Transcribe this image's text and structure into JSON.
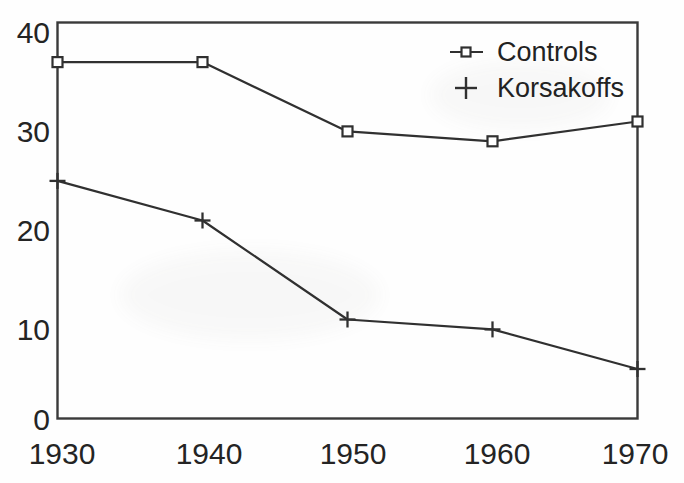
{
  "chart_data": {
    "type": "line",
    "title": "",
    "subtitle": "",
    "xlabel": "",
    "ylabel": "",
    "x": [
      1930,
      1940,
      1950,
      1960,
      1970
    ],
    "categories": [
      "1930",
      "1940",
      "1950",
      "1960",
      "1970"
    ],
    "series": [
      {
        "name": "Controls",
        "marker": "open-square",
        "color": "#303030",
        "values": [
          36,
          36,
          29,
          28,
          30
        ]
      },
      {
        "name": "Korsakoffs",
        "marker": "plus",
        "color": "#303030",
        "values": [
          24,
          20,
          10,
          9,
          5
        ]
      }
    ],
    "xlim": [
      1930,
      1970
    ],
    "ylim": [
      0,
      40
    ],
    "y_ticks": [
      0,
      10,
      20,
      30,
      40
    ],
    "y_tick_labels": [
      "0",
      "10",
      "20",
      "30",
      "40"
    ],
    "x_ticks": [
      1930,
      1940,
      1950,
      1960,
      1970
    ],
    "x_tick_labels": [
      "1930",
      "1940",
      "1950",
      "1960",
      "1970"
    ],
    "grid": false,
    "legend_position": "top-right",
    "frame": "box"
  },
  "legend": {
    "entries": [
      {
        "label": "Controls",
        "marker": "open-square-with-line"
      },
      {
        "label": "Korsakoffs",
        "marker": "plus"
      }
    ]
  },
  "axes": {
    "y_labels": [
      "40",
      "30",
      "20",
      "10",
      "0"
    ],
    "x_labels": [
      "1930",
      "1940",
      "1950",
      "1960",
      "1970"
    ]
  },
  "colors": {
    "ink": "#303030",
    "text": "#242424",
    "background": "#fefefe"
  }
}
